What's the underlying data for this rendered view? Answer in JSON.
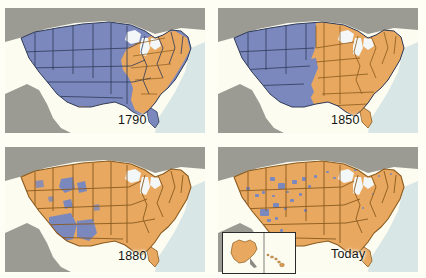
{
  "figure": {
    "panel_count": 4,
    "layout": "2x2 grid"
  },
  "colors": {
    "page_background": "#fffef5",
    "map_background": "#fdfcf1",
    "settled_orange": "#e8a860",
    "unsettled_blue": "#7b88be",
    "neighbor_gray": "#9b9b93",
    "water_blue": "#bcd4dd",
    "lake_white": "#f3f7f8",
    "border_line": "#2f3a57",
    "border_line_orange": "#8a5a1d",
    "label_text": "#141414",
    "inset_border": "#2b2b2b"
  },
  "legend_meaning": {
    "orange": "Settled / organized territory",
    "blue": "Unsettled / unorganized territory"
  },
  "panels": [
    {
      "id": "panel-1790",
      "label": "1790",
      "position": "top-left",
      "has_inset": false,
      "dominant_color": "#7b88be",
      "description": "Orange settlement confined to the eastern seaboard; interior blue"
    },
    {
      "id": "panel-1850",
      "label": "1850",
      "position": "top-right",
      "has_inset": false,
      "dominant_color": "#e8a860",
      "description": "Orange settlement reaching past the Mississippi; western third blue"
    },
    {
      "id": "panel-1880",
      "label": "1880",
      "position": "bottom-left",
      "has_inset": false,
      "dominant_color": "#e8a860",
      "description": "Nearly all orange; blue remains in the Southwest and scattered reservations"
    },
    {
      "id": "panel-today",
      "label": "Today",
      "position": "bottom-right",
      "has_inset": true,
      "dominant_color": "#e8a860",
      "inset_label": "Alaska and Hawaii inset",
      "description": "All orange with small scattered blue reservation parcels"
    }
  ]
}
